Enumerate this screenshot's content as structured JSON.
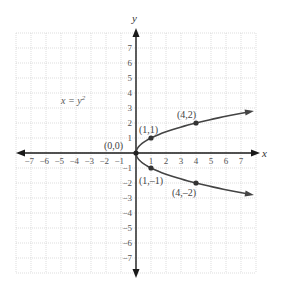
{
  "chart_data": {
    "type": "line",
    "title": "",
    "xlabel": "x",
    "ylabel": "y",
    "xlim": [
      -8,
      8
    ],
    "ylim": [
      -8,
      8
    ],
    "grid": true,
    "x_ticks": [
      -7,
      -6,
      -5,
      -4,
      -3,
      -2,
      -1,
      1,
      2,
      3,
      4,
      5,
      6,
      7
    ],
    "y_ticks": [
      -7,
      -6,
      -5,
      -4,
      -3,
      -2,
      -1,
      1,
      2,
      3,
      4,
      5,
      6,
      7
    ],
    "x_tick_labels": [
      "−7",
      "−6",
      "−5",
      "−4",
      "−3",
      "−2",
      "−1",
      "1",
      "2",
      "3",
      "4",
      "5",
      "6",
      "7"
    ],
    "y_tick_labels": [
      "−7",
      "−6",
      "−5",
      "−4",
      "−3",
      "−2",
      "−1",
      "1",
      "2",
      "3",
      "4",
      "5",
      "6",
      "7"
    ],
    "series": [
      {
        "name": "x = y²",
        "equation": "x = y^2",
        "color": "#444444",
        "points": [
          {
            "x": 0,
            "y": 0,
            "label": "(0,0)"
          },
          {
            "x": 1,
            "y": 1,
            "label": "(1,1)"
          },
          {
            "x": 4,
            "y": 2,
            "label": "(4,2)"
          },
          {
            "x": 1,
            "y": -1,
            "label": "(1,–1)"
          },
          {
            "x": 4,
            "y": -2,
            "label": "(4,–2)"
          }
        ]
      }
    ],
    "annotations": [
      {
        "text": "x = y²",
        "x": -5,
        "y": 3.5
      }
    ]
  },
  "labels": {
    "x_axis": "x",
    "y_axis": "y",
    "equation_text": "x = y",
    "equation_exp": "2",
    "p00": "(0,0)",
    "p11": "(1,1)",
    "p42": "(4,2)",
    "p1m1": "(1,–1)",
    "p4m2": "(4,–2)"
  }
}
